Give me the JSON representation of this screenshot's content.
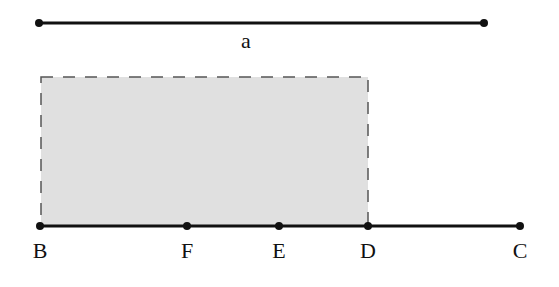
{
  "diagram": {
    "segment_a": {
      "label": "a",
      "x1": 39,
      "y1": 23,
      "x2": 484,
      "y2": 23,
      "label_x": 246,
      "label_y": 48
    },
    "rectangle": {
      "x": 41,
      "y": 77,
      "width": 327,
      "height": 149,
      "fill": "#e0e0e0",
      "stroke": "#555555",
      "dashed": true
    },
    "baseline": {
      "x1": 40,
      "y1": 226,
      "x2": 520,
      "y2": 226,
      "color": "#111111"
    },
    "points": [
      {
        "name": "B",
        "x": 40,
        "y": 226
      },
      {
        "name": "F",
        "x": 187,
        "y": 226
      },
      {
        "name": "E",
        "x": 279,
        "y": 226
      },
      {
        "name": "D",
        "x": 368,
        "y": 226
      },
      {
        "name": "C",
        "x": 520,
        "y": 226
      }
    ],
    "point_labels_y": 258
  }
}
